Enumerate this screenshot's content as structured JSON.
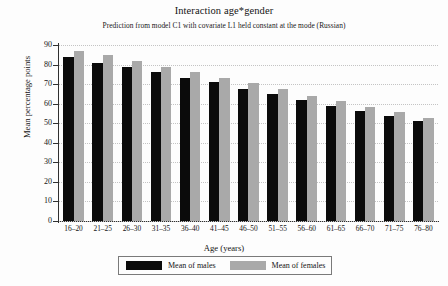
{
  "chart_data": {
    "type": "bar",
    "title": "Interaction age*gender",
    "subtitle": "Prediction from model C1 with covariate L1 held constant at the mode (Russian)",
    "xlabel": "Age (years)",
    "ylabel": "Mean percentage points",
    "categories": [
      "16–20",
      "21–25",
      "26–30",
      "31–35",
      "36–40",
      "41–45",
      "46–50",
      "51–55",
      "56–60",
      "61–65",
      "66–70",
      "71–75",
      "76–80"
    ],
    "series": [
      {
        "name": "Mean of males",
        "color": "#0b0b0b",
        "values": [
          84,
          81,
          79,
          76,
          73,
          71,
          67.5,
          65,
          62,
          59,
          56.5,
          53.5,
          51
        ]
      },
      {
        "name": "Mean of females",
        "color": "#a9a9a9",
        "values": [
          87,
          85,
          82,
          79,
          76,
          73,
          70.5,
          67.5,
          64,
          61.5,
          58.5,
          56,
          52.5
        ]
      }
    ],
    "ylim": [
      0,
      90
    ],
    "yticks": [
      0,
      10,
      20,
      30,
      40,
      50,
      60,
      70,
      80,
      90
    ],
    "ytick_labels": [
      "0",
      "10",
      "20",
      "30",
      "40",
      "50",
      "60",
      "70",
      "80",
      "90"
    ],
    "grid": "horizontal-dotted",
    "legend_position": "bottom"
  },
  "legend": {
    "entries": [
      {
        "label": "Mean of males",
        "swatch": "black-swatch"
      },
      {
        "label": "Mean of females",
        "swatch": "gray-swatch"
      }
    ]
  }
}
